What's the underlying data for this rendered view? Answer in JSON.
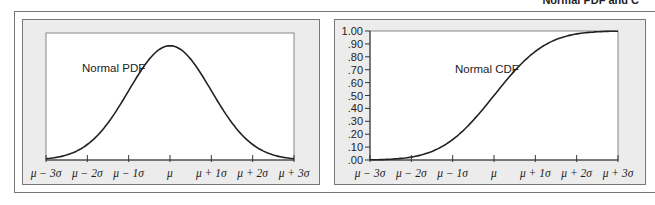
{
  "header": {
    "title": "Normal PDF and C"
  },
  "chart_data": [
    {
      "type": "line",
      "title": "",
      "annotation": "Normal PDF",
      "xlabel": "",
      "ylabel": "",
      "x_ticks": [
        "μ − 3σ",
        "μ − 2σ",
        "μ − 1σ",
        "μ",
        "μ + 1σ",
        "μ + 2σ",
        "μ + 3σ"
      ],
      "x": [
        -3,
        -2,
        -1,
        0,
        1,
        2,
        3
      ],
      "values": [
        0.0044,
        0.054,
        0.242,
        0.399,
        0.242,
        0.054,
        0.0044
      ],
      "grid": false
    },
    {
      "type": "line",
      "title": "",
      "annotation": "Normal CDF",
      "xlabel": "",
      "ylabel": "",
      "x_ticks": [
        "μ − 3σ",
        "μ − 2σ",
        "μ − 1σ",
        "μ",
        "μ + 1σ",
        "μ + 2σ",
        "μ + 3σ"
      ],
      "y_ticks": [
        "1.00",
        ".90",
        ".80",
        ".70",
        ".60",
        ".50",
        ".40",
        ".30",
        ".20",
        ".10",
        ".00"
      ],
      "ylim": [
        0,
        1
      ],
      "x": [
        -3,
        -2,
        -1,
        0,
        1,
        2,
        3
      ],
      "values": [
        0.0013,
        0.0228,
        0.1587,
        0.5,
        0.8413,
        0.9772,
        0.9987
      ],
      "grid": false
    }
  ]
}
